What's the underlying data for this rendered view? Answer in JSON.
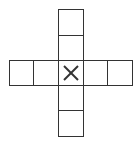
{
  "diagram": {
    "type": "cube-net-cross",
    "stroke_color": "#333333",
    "background": "#ffffff",
    "cells": [
      {
        "id": "top-1",
        "x": 58,
        "y": 9,
        "w": 26,
        "h": 27,
        "mark": ""
      },
      {
        "id": "top-2",
        "x": 58,
        "y": 35,
        "w": 26,
        "h": 26,
        "mark": ""
      },
      {
        "id": "left-1",
        "x": 9,
        "y": 60,
        "w": 25,
        "h": 26,
        "mark": ""
      },
      {
        "id": "left-2",
        "x": 33,
        "y": 60,
        "w": 26,
        "h": 26,
        "mark": ""
      },
      {
        "id": "center",
        "x": 58,
        "y": 60,
        "w": 26,
        "h": 26,
        "mark": "X"
      },
      {
        "id": "right-1",
        "x": 83,
        "y": 60,
        "w": 25,
        "h": 26,
        "mark": ""
      },
      {
        "id": "right-2",
        "x": 107,
        "y": 60,
        "w": 26,
        "h": 26,
        "mark": ""
      },
      {
        "id": "bottom-1",
        "x": 58,
        "y": 85,
        "w": 26,
        "h": 26,
        "mark": ""
      },
      {
        "id": "bottom-2",
        "x": 58,
        "y": 110,
        "w": 26,
        "h": 27,
        "mark": ""
      }
    ],
    "center_mark": "X"
  }
}
